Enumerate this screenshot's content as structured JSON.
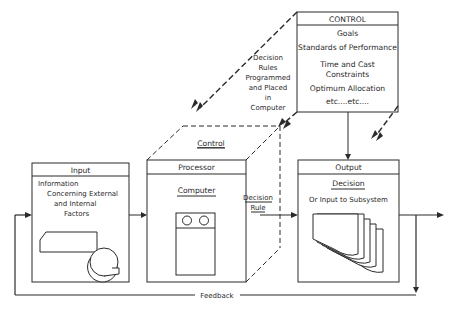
{
  "control_box": {
    "title": "CONTROL",
    "items": [
      "Goals",
      "Standards of Performance",
      "Time and Cast",
      "Constraints",
      "Optimum Allocation",
      "etc....etc...."
    ]
  },
  "decision_rules_note": {
    "lines": [
      "Decision",
      "Rules",
      "Programmed",
      "and Placed",
      "in",
      "Computer"
    ]
  },
  "input_box": {
    "title": "Input",
    "lines": [
      "Information",
      "Concerning External",
      "and Internal",
      "Factors"
    ],
    "icon": "card-and-tape-icon"
  },
  "processor_box": {
    "top_label": "Control",
    "title": "Processor",
    "subtitle": "Computer",
    "icon": "computer-tape-unit-icon"
  },
  "decision_rule_arrow": {
    "lines": [
      "Decision",
      "Rule"
    ]
  },
  "output_box": {
    "title": "Output",
    "subtitle": "Decision",
    "description": "Or Input to Subsystem",
    "icon": "document-stack-icon"
  },
  "feedback": {
    "label": "Feedback"
  },
  "colors": {
    "line": "#2a2a2a",
    "background": "#ffffff"
  }
}
